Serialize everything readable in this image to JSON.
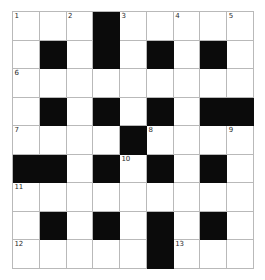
{
  "puzzle": {
    "title": "Crossword Grid",
    "type": "crossword",
    "rows": 9,
    "cols": 9,
    "colors": {
      "block": "#0b0b0b",
      "open": "#ffffff",
      "gridline": "#b9b9b9",
      "number_text": "#2b2b2b",
      "page_background": "#ffffff"
    },
    "legend": {
      "black_symbol": "block",
      "white_symbol": "open"
    },
    "grid": [
      [
        "open",
        "open",
        "open",
        "block",
        "open",
        "open",
        "open",
        "open",
        "open"
      ],
      [
        "open",
        "block",
        "open",
        "block",
        "open",
        "block",
        "open",
        "block",
        "open"
      ],
      [
        "open",
        "open",
        "open",
        "open",
        "open",
        "open",
        "open",
        "open",
        "open"
      ],
      [
        "open",
        "block",
        "open",
        "block",
        "open",
        "block",
        "open",
        "block",
        "block"
      ],
      [
        "open",
        "open",
        "open",
        "open",
        "block",
        "open",
        "open",
        "open",
        "open"
      ],
      [
        "block",
        "block",
        "open",
        "block",
        "open",
        "block",
        "open",
        "block",
        "open"
      ],
      [
        "open",
        "open",
        "open",
        "open",
        "open",
        "open",
        "open",
        "open",
        "open"
      ],
      [
        "open",
        "block",
        "open",
        "block",
        "open",
        "block",
        "open",
        "block",
        "open"
      ],
      [
        "open",
        "open",
        "open",
        "open",
        "open",
        "block",
        "open",
        "open",
        "open"
      ]
    ],
    "numbers": [
      {
        "label": "1",
        "row": 0,
        "col": 0
      },
      {
        "label": "2",
        "row": 0,
        "col": 2
      },
      {
        "label": "3",
        "row": 0,
        "col": 4
      },
      {
        "label": "4",
        "row": 0,
        "col": 6
      },
      {
        "label": "5",
        "row": 0,
        "col": 8
      },
      {
        "label": "6",
        "row": 2,
        "col": 0
      },
      {
        "label": "7",
        "row": 4,
        "col": 0
      },
      {
        "label": "8",
        "row": 4,
        "col": 5
      },
      {
        "label": "9",
        "row": 4,
        "col": 8
      },
      {
        "label": "10",
        "row": 5,
        "col": 4
      },
      {
        "label": "11",
        "row": 6,
        "col": 0
      },
      {
        "label": "12",
        "row": 8,
        "col": 0
      },
      {
        "label": "13",
        "row": 8,
        "col": 6
      }
    ]
  }
}
